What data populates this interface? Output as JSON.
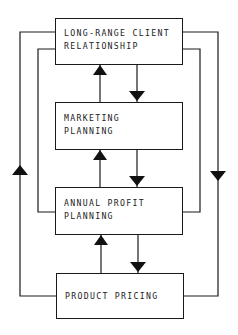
{
  "diagram": {
    "boxes": [
      {
        "id": "long-range",
        "line1": "LONG-RANGE CLIENT",
        "line2": "RELATIONSHIP"
      },
      {
        "id": "marketing",
        "line1": "MARKETING",
        "line2": "PLANNING"
      },
      {
        "id": "annual-profit",
        "line1": "ANNUAL PROFIT",
        "line2": "PLANNING"
      },
      {
        "id": "product-pricing",
        "line1": "PRODUCT PRICING",
        "line2": ""
      }
    ],
    "connections": [
      {
        "from": "marketing",
        "to": "long-range",
        "direction": "up"
      },
      {
        "from": "long-range",
        "to": "marketing",
        "direction": "down"
      },
      {
        "from": "annual-profit",
        "to": "marketing",
        "direction": "up"
      },
      {
        "from": "marketing",
        "to": "annual-profit",
        "direction": "down"
      },
      {
        "from": "product-pricing",
        "to": "annual-profit",
        "direction": "up"
      },
      {
        "from": "annual-profit",
        "to": "product-pricing",
        "direction": "down"
      },
      {
        "from": "product-pricing",
        "to": "long-range",
        "direction": "up",
        "route": "outer-left"
      },
      {
        "from": "long-range",
        "to": "product-pricing",
        "direction": "down",
        "route": "outer-right"
      },
      {
        "from": "annual-profit",
        "to": "long-range",
        "route": "inner-left"
      },
      {
        "from": "long-range",
        "to": "annual-profit",
        "route": "inner-right"
      }
    ],
    "colors": {
      "line": "#1a1a1a",
      "background": "#ffffff"
    }
  }
}
